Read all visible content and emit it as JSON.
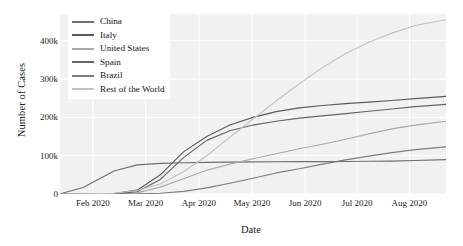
{
  "chart_data": {
    "type": "line",
    "title": "",
    "xlabel": "Date",
    "ylabel": "Number of Cases",
    "grid": true,
    "legend_position": "top-left",
    "xlim": [
      "2020-01-22",
      "2020-08-20"
    ],
    "ylim": [
      0,
      470000
    ],
    "x_tick_labels": [
      "Feb 2020",
      "Mar 2020",
      "Apr 2020",
      "May 2020",
      "Jun 2020",
      "Jul 2020",
      "Aug 2020"
    ],
    "y_tick_labels": [
      "0",
      "100k",
      "200k",
      "300k",
      "400k"
    ],
    "y_tick_values": [
      0,
      100000,
      200000,
      300000,
      400000
    ],
    "x": [
      "2020-01-22",
      "2020-02-01",
      "2020-02-15",
      "2020-03-01",
      "2020-03-15",
      "2020-04-01",
      "2020-04-15",
      "2020-05-01",
      "2020-05-15",
      "2020-06-01",
      "2020-06-15",
      "2020-07-01",
      "2020-07-15",
      "2020-08-01",
      "2020-08-20"
    ],
    "series": [
      {
        "name": "China",
        "color": "#6e6e6e",
        "values": [
          600,
          12000,
          57000,
          80000,
          81000,
          82000,
          83500,
          84000,
          84500,
          84600,
          84800,
          85200,
          85600,
          88800,
          89600
        ]
      },
      {
        "name": "Italy",
        "color": "#5a5a5a",
        "values": [
          0,
          0,
          3,
          1700,
          24700,
          110500,
          165200,
          207400,
          223900,
          233200,
          237300,
          240800,
          243600,
          248200,
          255600
        ]
      },
      {
        "name": "United States",
        "color": "#a8a8a8",
        "values": [
          1,
          8,
          15,
          75,
          3500,
          213000,
          636000,
          1103000,
          1420000,
          1790000,
          2130000,
          2686000,
          3480000,
          4570000,
          5600000
        ]
      },
      {
        "name": "Spain",
        "color": "#646464",
        "values": [
          0,
          0,
          2,
          84,
          7800,
          104100,
          177600,
          213400,
          230700,
          239600,
          244100,
          250000,
          258900,
          335600,
          400000
        ]
      },
      {
        "name": "Brazil",
        "color": "#7d7d7d",
        "values": [
          0,
          0,
          0,
          2,
          200,
          6800,
          28300,
          92200,
          233500,
          514800,
          867600,
          1448800,
          1966700,
          2733700,
          3500000
        ]
      },
      {
        "name": "Rest of the World",
        "color": "#c2c2c2",
        "values": [
          0,
          200,
          900,
          4000,
          42000,
          390000,
          1000000,
          1900000,
          2700000,
          3800000,
          5100000,
          7000000,
          9300000,
          12500000,
          16000000
        ]
      }
    ],
    "plotted_normalized": {
      "note": "Pixel-read series values as plotted on the 0-470k axis",
      "x": [
        0,
        0.06,
        0.14,
        0.2,
        0.26,
        0.32,
        0.38,
        0.44,
        0.5,
        0.56,
        0.62,
        0.68,
        0.74,
        0.8,
        0.86,
        0.92,
        1.0
      ],
      "series": [
        {
          "name": "China",
          "values": [
            600,
            17000,
            60000,
            76000,
            80000,
            81500,
            82500,
            83200,
            83800,
            84100,
            84400,
            84700,
            85000,
            85400,
            86000,
            87500,
            89600
          ]
        },
        {
          "name": "Italy",
          "values": [
            0,
            5,
            900,
            10000,
            50000,
            110000,
            150000,
            180000,
            200000,
            215000,
            225000,
            231000,
            236000,
            240000,
            244000,
            249000,
            255000
          ]
        },
        {
          "name": "United States",
          "values": [
            0,
            10,
            300,
            3000,
            18000,
            40000,
            62000,
            78000,
            92000,
            105000,
            118000,
            130000,
            143000,
            157000,
            170000,
            180000,
            190000
          ]
        },
        {
          "name": "Spain",
          "values": [
            0,
            2,
            400,
            6000,
            38000,
            95000,
            140000,
            165000,
            180000,
            190000,
            198000,
            204000,
            210000,
            216000,
            222000,
            228000,
            234000
          ]
        },
        {
          "name": "Brazil",
          "values": [
            0,
            0,
            10,
            300,
            2000,
            7000,
            16000,
            28000,
            41000,
            55000,
            66000,
            78000,
            89000,
            99000,
            108000,
            116000,
            123000
          ]
        },
        {
          "name": "Rest of the World",
          "values": [
            0,
            300,
            2000,
            9000,
            26000,
            58000,
            100000,
            148000,
            196000,
            243000,
            288000,
            330000,
            367000,
            396000,
            420000,
            440000,
            455000
          ]
        }
      ]
    }
  }
}
